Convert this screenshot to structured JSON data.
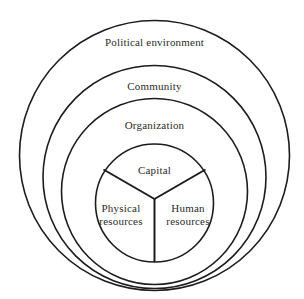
{
  "diagram": {
    "background_color": "#ffffff",
    "stroke_color": "#1c1c1c",
    "text_color": "#2b2b2b",
    "rings": [
      {
        "id": "political-environment",
        "label": "Political environment",
        "cx": 154.5,
        "cy": 155.5,
        "r": 135.0
      },
      {
        "id": "community",
        "label": "Community",
        "cx": 154.5,
        "cy": 177.0,
        "r": 111.5
      },
      {
        "id": "organization",
        "label": "Organization",
        "cx": 154.5,
        "cy": 191.5,
        "r": 93.0
      },
      {
        "id": "core",
        "label": "",
        "cx": 154.5,
        "cy": 203.0,
        "r": 59.0
      }
    ],
    "core_sectors": [
      {
        "id": "capital",
        "label": "Capital"
      },
      {
        "id": "physical-resources",
        "label": "Physical\nresources"
      },
      {
        "id": "human-resources",
        "label": "Human\nresources"
      }
    ],
    "core_divider": {
      "junction_x": 154.5,
      "junction_y": 199.0,
      "spokes": [
        {
          "id": "spoke-upper-left",
          "x": 103.5,
          "y": 169.5
        },
        {
          "id": "spoke-upper-right",
          "x": 205.5,
          "y": 169.5
        },
        {
          "id": "spoke-down",
          "x": 154.5,
          "y": 262.0
        }
      ]
    }
  }
}
